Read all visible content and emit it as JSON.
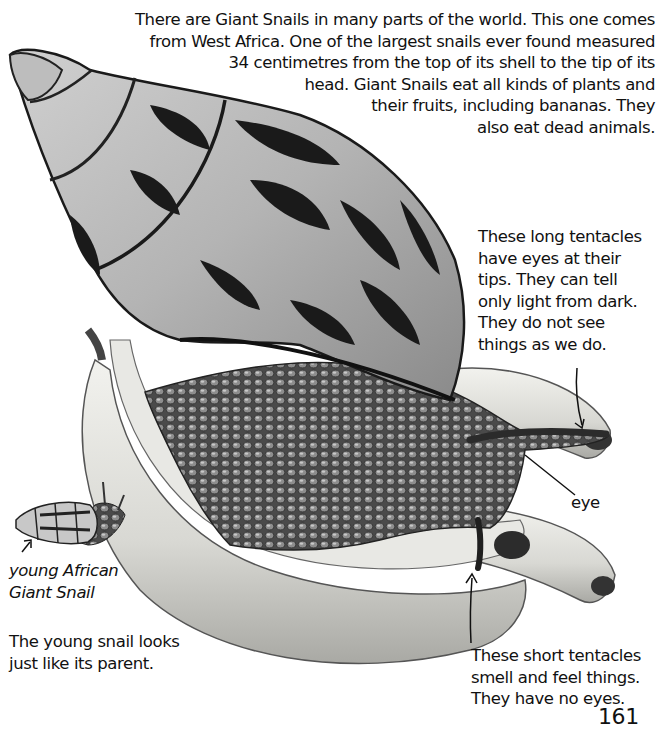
{
  "intro_paragraph": {
    "lines": [
      "There are Giant Snails in many parts of the world. This one comes",
      "from West Africa. One of the largest snails ever found measured",
      "34 centimetres from the top of its shell to the tip of its",
      "head. Giant Snails eat all kinds of plants and",
      "their fruits, including bananas. They",
      "also eat dead animals."
    ]
  },
  "long_tentacles_note": {
    "lines": [
      "These long tentacles",
      "have eyes at their",
      "tips. They can tell",
      "only light from dark.",
      "They do not see",
      "things as we do."
    ]
  },
  "eye_label": "eye",
  "young_snail_caption": {
    "lines": [
      "young African",
      "Giant Snail"
    ]
  },
  "young_snail_note": {
    "lines": [
      "The young snail looks",
      "just like its parent."
    ]
  },
  "short_tentacles_note": {
    "lines": [
      "These short tentacles",
      "smell and feel things.",
      "They have no eyes."
    ]
  },
  "page_number": "161",
  "illustration": {
    "subjects": [
      "giant-african-snail",
      "bananas",
      "young-snail"
    ],
    "palette": {
      "dark": "#1a1a1a",
      "mid": "#7a7a7a",
      "light": "#d9d9d9",
      "banana": "#e6e6e2"
    }
  }
}
